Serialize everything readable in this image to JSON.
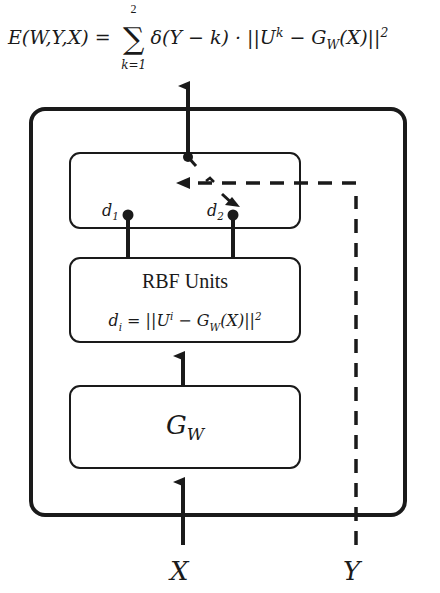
{
  "energy_equation": {
    "lhs": "E(W,Y,X) = ",
    "sum_upper": "2",
    "sum_symbol": "∑",
    "sum_lower": "k=1",
    "rhs": "δ(Y − k) · ||U",
    "rhs_sup": "k",
    "rhs_mid": " − G",
    "rhs_sub": "W",
    "rhs_end": "(X)||",
    "rhs_end_sup": "2"
  },
  "switch_box": {
    "d1_label": "d",
    "d1_sub": "1",
    "d2_label": "d",
    "d2_sub": "2"
  },
  "rbf_box": {
    "title": "RBF Units",
    "formula_pre": "d",
    "formula_pre_sub": "i",
    "formula_mid": " = ||U",
    "formula_sup": "i",
    "formula_g": " − G",
    "formula_g_sub": "W",
    "formula_end": "(X)||",
    "formula_end_sup": "2"
  },
  "gw_box": {
    "label": "G",
    "label_sub": "W"
  },
  "inputs": {
    "x_label": "X",
    "y_label": "Y"
  },
  "colors": {
    "stroke": "#1a1a1a",
    "background": "#ffffff"
  }
}
